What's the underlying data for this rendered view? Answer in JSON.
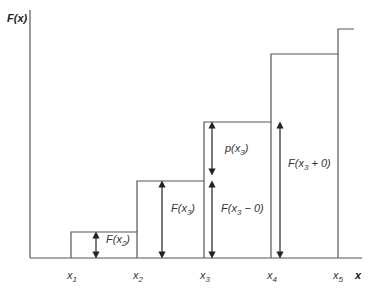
{
  "diagram": {
    "type": "step-function-cdf",
    "y_axis_label": "F(x)",
    "x_axis_label": "x",
    "line_color": "#555555",
    "x_ticks": [
      {
        "base": "x",
        "sub": "1"
      },
      {
        "base": "x",
        "sub": "2"
      },
      {
        "base": "x",
        "sub": "3"
      },
      {
        "base": "x",
        "sub": "4"
      },
      {
        "base": "x",
        "sub": "5"
      }
    ],
    "annotations": {
      "f_x2": {
        "pre": "F(x",
        "sub": "2",
        "post": ")"
      },
      "f_x3": {
        "pre": "F(x",
        "sub": "3",
        "post": ")"
      },
      "p_x3": {
        "pre": "p(x",
        "sub": "3",
        "post": ")"
      },
      "f_x3_minus_0": {
        "pre": "F(x",
        "sub": "3",
        "post": " − 0)"
      },
      "f_x3_plus_0": {
        "pre": "F(x",
        "sub": "3",
        "post": " + 0)"
      }
    }
  }
}
